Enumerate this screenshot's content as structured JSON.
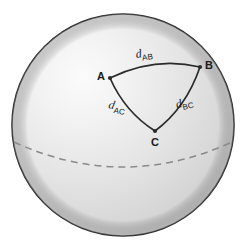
{
  "figure": {
    "name": "spherical-triangle-diagram",
    "background_color": "#ffffff"
  },
  "sphere": {
    "center_x": 123,
    "center_y": 125,
    "radius": 111,
    "outline_color": "#2b2b2b",
    "outline_width": 1.6,
    "fill_light": "#f2f2f2",
    "fill_mid": "#dcdcdc",
    "fill_dark": "#bdbdbd",
    "highlight_x": 85,
    "highlight_y": 88
  },
  "equator": {
    "name": "dashed-equator-arc",
    "stroke_color": "#8a8a8a",
    "stroke_width": 1.5,
    "dash_pattern": "7 5",
    "left_x": 14,
    "left_y": 142,
    "right_x": 232,
    "right_y": 142,
    "sag_y": 167
  },
  "triangle": {
    "stroke_color": "#2b2b2b",
    "stroke_width": 1.6,
    "vertices": [
      {
        "id": "A",
        "label": "A",
        "x": 110,
        "y": 78
      },
      {
        "id": "B",
        "label": "B",
        "x": 200,
        "y": 67
      },
      {
        "id": "C",
        "label": "C",
        "x": 155,
        "y": 131
      }
    ],
    "edges": [
      {
        "id": "AB",
        "label_d": "d",
        "label_sub": "AB",
        "from": "A",
        "to": "B"
      },
      {
        "id": "AC",
        "label_d": "d",
        "label_sub": "AC",
        "from": "A",
        "to": "C"
      },
      {
        "id": "BC",
        "label_d": "d",
        "label_sub": "BC",
        "from": "B",
        "to": "C"
      }
    ]
  },
  "labels": {
    "vertex_a": "A",
    "vertex_b": "B",
    "vertex_c": "C",
    "d_ab_base": "d",
    "d_ab_sub": "AB",
    "d_ac_base": "d",
    "d_ac_sub": "AC",
    "d_bc_base": "d",
    "d_bc_sub": "BC"
  }
}
